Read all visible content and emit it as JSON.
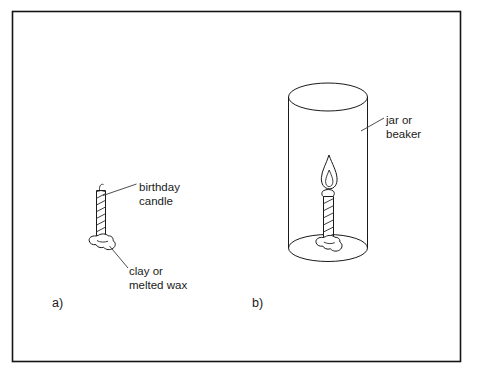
{
  "figure": {
    "background_color": "#ffffff",
    "ink_color": "#1a1a1a",
    "frame": {
      "x": 12,
      "y": 11,
      "width": 449,
      "height": 351
    }
  },
  "panels": [
    {
      "id": "a",
      "letter": "a)",
      "letter_x": 52,
      "letter_y": 307,
      "description": "Unlit birthday candle standing in clay or melted wax"
    },
    {
      "id": "b",
      "letter": "b)",
      "letter_x": 252,
      "letter_y": 307,
      "description": "Lit birthday candle standing in clay inside a jar or beaker"
    }
  ],
  "labels": [
    {
      "name": "birthday-candle",
      "lines": [
        "birthday",
        "candle"
      ],
      "x": 139,
      "y": 191,
      "line_height": 14
    },
    {
      "name": "clay-or-melted-wax",
      "lines": [
        "clay or",
        "melted wax"
      ],
      "x": 129,
      "y": 275,
      "line_height": 14
    },
    {
      "name": "jar-or-beaker",
      "lines": [
        "jar or",
        "beaker"
      ],
      "x": 386,
      "y": 124,
      "line_height": 14
    }
  ],
  "objects": {
    "candle_a": {
      "name": "unlit-birthday-candle",
      "stripe_count": 7,
      "lit": false
    },
    "clay_a": {
      "name": "clay-blob",
      "shape": "irregular-blob"
    },
    "jar_b": {
      "name": "jar-or-beaker",
      "shape": "open-cylinder",
      "top_center": [
        328,
        97
      ],
      "bottom_center": [
        328,
        248
      ],
      "radius_x": 40,
      "radius_y": 13
    },
    "candle_b": {
      "name": "lit-birthday-candle",
      "stripe_count": 5,
      "lit": true,
      "flame": "two-layer"
    },
    "clay_b": {
      "name": "clay-blob",
      "shape": "irregular-blob"
    }
  }
}
